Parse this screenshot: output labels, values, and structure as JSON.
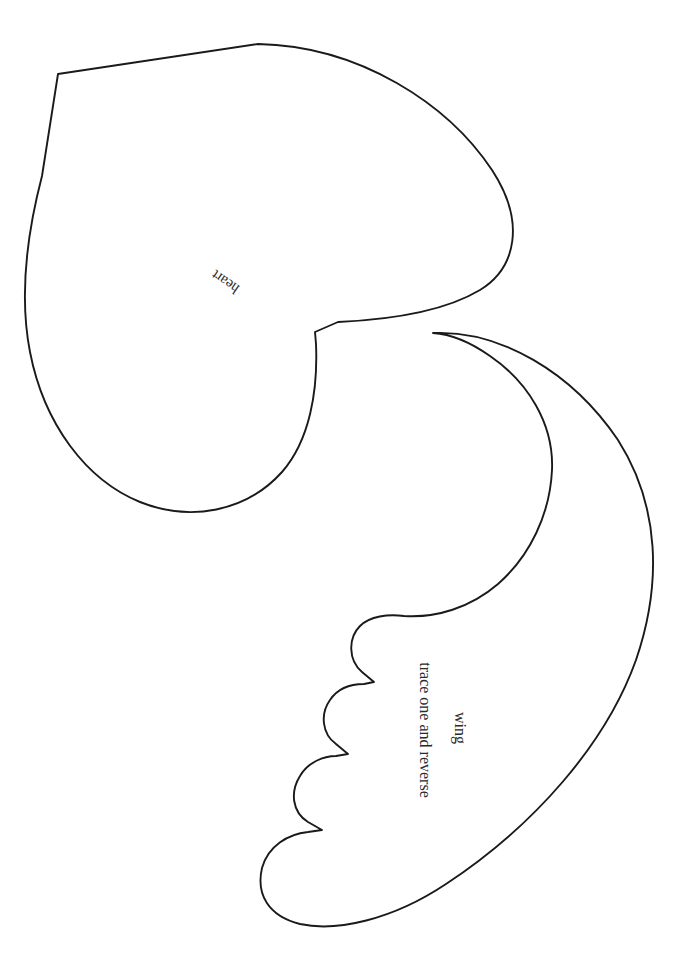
{
  "document": {
    "title": "heart and wing craft template",
    "kind": "printable cut-out pattern sheet",
    "background_color": "#ffffff",
    "ink_color": "#1a1a1a",
    "page_width": 700,
    "page_height": 978
  },
  "shapes": {
    "heart": {
      "name": "heart",
      "label": "heart",
      "label_rotation_deg": 215,
      "label_x": 228,
      "label_y": 278,
      "stroke_color": "#1a1a1a",
      "fill_color": "#ffffff",
      "path": "M 58 74 L 258 44 C 360 46 448 104 492 170 C 526 222 516 268 480 290 C 440 314 382 320 338 322 L 315 332 L 316 344 C 318 390 310 440 282 472 C 246 512 190 522 140 502 C 86 480 44 424 30 352 C 18 290 30 222 42 176 Z"
    },
    "wing": {
      "name": "wing",
      "label": "wing",
      "sublabel": "trace one and reverse",
      "label_rotation_deg": 90,
      "label_x": 455,
      "label_y": 728,
      "sublabel_x": 420,
      "sublabel_y": 730,
      "stroke_color": "#1a1a1a",
      "fill_color": "#ffffff",
      "path": "M 433 333 C 500 330 572 372 618 440 C 660 506 662 584 636 660 C 606 744 534 826 446 884 C 392 920 336 932 300 924 C 268 916 256 894 262 868 C 268 846 288 834 308 832 L 322 830 L 308 822 C 292 812 290 792 300 776 C 308 762 324 756 336 756 L 348 754 L 336 744 C 322 734 320 714 330 700 C 338 688 352 684 364 684 L 374 682 L 362 672 C 348 660 348 638 360 626 C 370 616 388 614 404 616 C 436 618 470 608 498 584 C 530 556 550 514 552 470 C 554 424 528 382 490 356 C 470 342 450 334 433 333 Z"
    }
  },
  "labels": {
    "heart": "heart",
    "wing": "wing",
    "wing_instruction": "trace one and reverse"
  }
}
